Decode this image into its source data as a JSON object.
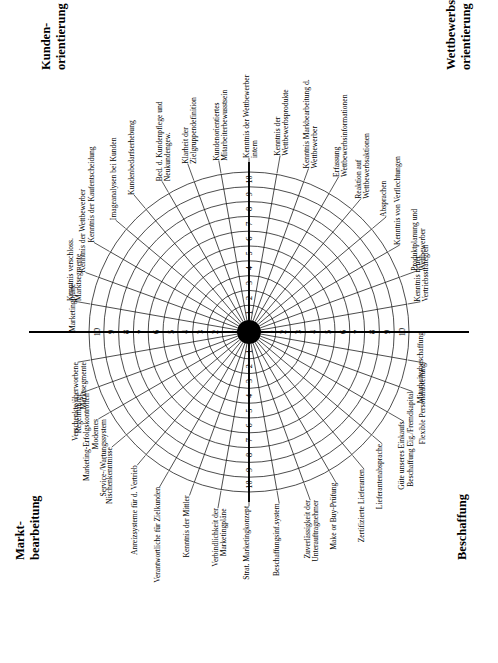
{
  "figure": {
    "background": "#ffffff",
    "line_color": "#111111",
    "axis_color": "#000000",
    "rotation_note": "page rotated 90 degrees; all text reads bottom-to-top",
    "quadrant_titles": {
      "top_left": "Kunden-\norientierung",
      "top_right": "Wettbewerbs-\norientierung",
      "bottom_left": "Markt-\nbearbeitung",
      "bottom_right": "Beschaffung"
    },
    "quadrant_title_lines": {
      "kunden": [
        "Kunden-",
        "orientierung"
      ],
      "wettbewerb": [
        "Wettbewerbs-",
        "orientierung"
      ],
      "markt": [
        "Markt-",
        "bearbeitung"
      ],
      "beschaffung": [
        "Beschaffung"
      ]
    }
  },
  "chart_data": {
    "type": "radar",
    "title": "",
    "subtitle": "",
    "xlabel": "",
    "ylabel": "",
    "scale_min": 1,
    "scale_max": 10,
    "rings": 10,
    "grid": true,
    "legend_position": "none",
    "tick_labels": [
      "1",
      "2",
      "3",
      "4",
      "5",
      "6",
      "7",
      "8",
      "9",
      "10"
    ],
    "axis_tick_rows": {
      "vertical_up": [
        "1",
        "2",
        "3",
        "4",
        "5",
        "6",
        "7",
        "8",
        "9",
        "10"
      ],
      "vertical_down": [
        "1",
        "2",
        "3",
        "4",
        "5",
        "6",
        "7",
        "8",
        "9",
        "10"
      ],
      "horizontal_left": [
        "1",
        "2",
        "3",
        "4",
        "5",
        "6",
        "7",
        "8",
        "9",
        "10"
      ],
      "horizontal_right": [
        "1",
        "2",
        "3",
        "4",
        "5",
        "6",
        "7",
        "8",
        "9",
        "10"
      ]
    },
    "groups": [
      {
        "name": "Kundenorientierung",
        "title": "Kunden-orientierung",
        "quadrant": "top-left",
        "categories": [
          "Kundenorientiertes Mitarbeiterbewusstsein",
          "Klarheit der Zielgruppendefinition",
          "Bed. d. Kundenpflege und Neukundengew.",
          "Kundenbedarfserhebung",
          "Imageanalysen bei Kunden",
          "Kenntnis der Kaufentscheidung",
          "Kenntnis der Wettbewerber",
          "Kenntnis verschloss. Marktsegmente",
          "Marketingpläne"
        ]
      },
      {
        "name": "Wettbewerbsorientierung",
        "title": "Wettbewerbs-orientierung",
        "quadrant": "top-right",
        "categories": [
          "Kenntnis der Wettbewerber intern",
          "Kenntnis der Wettbewerbsprodukte",
          "Kenntnis Markbearbeitung d. Wettbewerber",
          "Erfassung Wettbewerbsinformationen",
          "Reaktion auf Wettbewerbsaktionen",
          "Absprachen",
          "Kenntnis von Verflechtungen",
          "Produktplanung und Wettbewerber",
          "Kenntnis neuer Vertriebsstrategien"
        ]
      },
      {
        "name": "Marktbearbeitung",
        "title": "Markt-bearbeitung",
        "quadrant": "bottom-left",
        "categories": [
          "Verschenkte/überworbene Marktsegmente",
          "Regelmäßige Marketing-Erfolgskontrollen",
          "Modernes Service-/Wartungssystem",
          "Nischenkenntnisse",
          "Anreizsysteme für d. Vertrieb",
          "Verantwortliche für Zielkunden",
          "Kenntnis der Mittler",
          "Verbindlichkeit der Marketingpläne",
          "Strat. Marketingkonzept"
        ]
      },
      {
        "name": "Beschaffung",
        "title": "Beschaffung",
        "quadrant": "bottom-right",
        "categories": [
          "Beschaffungsinf.system",
          "Zuverlässigkeit der Unterauftragnehmer",
          "Make or Buy-Prüfung",
          "Zertifizierte Lieferanten",
          "Lieferantenabsprache",
          "Güte unseres Einkaufs",
          "Beschaffung Eig./Fremdkapital",
          "Flexible Personalabteilung",
          "Mitarbeiterbeschaffung"
        ]
      }
    ]
  }
}
